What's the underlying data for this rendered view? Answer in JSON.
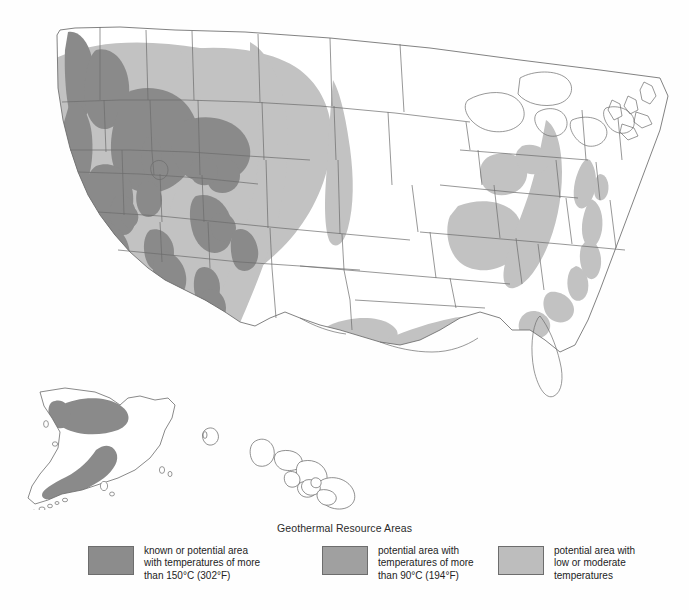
{
  "figure": {
    "kind": "thematic-map",
    "region": "United States including Alaska and Hawaii insets",
    "background_color": "#fefefe",
    "outline_color": "#6b6b6b"
  },
  "legend": {
    "title": "Geothermal Resource Areas",
    "items": [
      {
        "id": "high-temperature",
        "color": "#8c8c8c",
        "text": "known or potential area\nwith temperatures of more\nthan 150°C (302°F)",
        "line1": "known or potential area",
        "line2": "with temperatures of more",
        "line3": "than 150°C (302°F)"
      },
      {
        "id": "moderate-temperature",
        "color": "#a0a0a0",
        "text": "potential area with\ntemperatures of more\nthan 90°C (194°F)",
        "line1": "potential area with",
        "line2": "temperatures of more",
        "line3": "than 90°C (194°F)"
      },
      {
        "id": "low-moderate-temperature",
        "color": "#bdbdbd",
        "text": "potential area with\nlow or moderate\ntemperatures",
        "line1": "potential area with",
        "line2": "low or moderate",
        "line3": "temperatures"
      }
    ]
  },
  "map_data": {
    "type": "choropleth-overlay",
    "classes": [
      {
        "name": "known or potential area with temperatures of more than 150°C (302°F)",
        "color": "#8a8a8a"
      },
      {
        "name": "potential area with temperatures of more than 90°C (194°F)",
        "color": "#a3a3a3"
      },
      {
        "name": "potential area with low or moderate temperatures",
        "color": "#c2c2c2"
      }
    ],
    "regions_high": [
      "Cascade Range, Washington",
      "Central and southern Oregon Cascades",
      "Northern Nevada / Basin and Range",
      "Eastern Idaho / Yellowstone",
      "Southwestern Idaho",
      "Central California - Geysers / Coso",
      "Imperial Valley, southern California",
      "Southwestern New Mexico / Rio Grande rift",
      "Northwestern Colorado",
      "Southwestern Utah",
      "Alaska - Seward Peninsula",
      "Alaska - Alaska Peninsula and Aleutian chain"
    ],
    "regions_moderate": [
      "Western Montana",
      "Wyoming Basin",
      "Colorado Plateau",
      "Great Basin surround",
      "Northern Arizona"
    ],
    "regions_low": [
      "Western Great Plains - Montana to Texas",
      "Dakota escarpment",
      "Gulf Coast - Texas to Mississippi",
      "Illinois Basin",
      "Michigan Basin",
      "Appalachian Basin - New York to West Virginia",
      "Atlantic Coastal Plain - New Jersey to Georgia",
      "Central Oklahoma"
    ]
  }
}
